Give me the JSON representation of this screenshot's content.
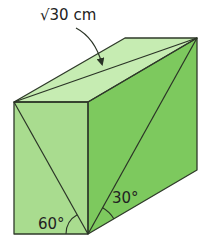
{
  "figure": {
    "type": "rectangular prism (cuboid)",
    "colors": {
      "front_face": "#a9dc8f",
      "right_face": "#7dc95e",
      "top_face": "#c6ecb2",
      "edge": "#2f3a2a",
      "text": "#222222"
    },
    "labels": {
      "top_diagonal": "√30 cm",
      "front_angle": "60°",
      "side_angle": "30°"
    },
    "annotations": [
      {
        "id": "top_diagonal",
        "text": "√30 cm",
        "points_to": "diagonal of top face",
        "style": "curved arrow"
      },
      {
        "id": "front_angle",
        "text": "60°",
        "location": "bottom-right corner of front face, between bottom edge and front-face diagonal"
      },
      {
        "id": "side_angle",
        "text": "30°",
        "location": "bottom-front corner of right face, between bottom edge and right-face diagonal"
      }
    ]
  }
}
